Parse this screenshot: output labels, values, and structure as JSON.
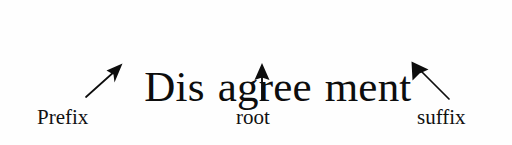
{
  "figure": {
    "kind": "word-morphology-diagram",
    "background_color": "#fefefe",
    "ink_color": "#0d0d0d"
  },
  "word": {
    "full": "Disagreement",
    "display": "Dis agree ment",
    "morphemes": [
      {
        "text": "Dis",
        "role": "prefix"
      },
      {
        "text": "agree",
        "role": "root"
      },
      {
        "text": "ment",
        "role": "suffix"
      }
    ]
  },
  "labels": [
    {
      "id": "prefix",
      "text": "Prefix"
    },
    {
      "id": "root",
      "text": "root"
    },
    {
      "id": "suffix",
      "text": "suffix"
    }
  ],
  "arrows": [
    {
      "id": "prefix-arrow",
      "points_to": "Dis",
      "direction": "up-right",
      "tail": [
        86,
        97
      ],
      "tip": [
        122,
        64
      ]
    },
    {
      "id": "root-arrow",
      "points_to": "agree",
      "direction": "up",
      "tail": [
        262,
        100
      ],
      "tip": [
        262,
        64
      ]
    },
    {
      "id": "suffix-arrow",
      "points_to": "ment",
      "direction": "up-left",
      "tail": [
        449,
        99
      ],
      "tip": [
        412,
        62
      ]
    }
  ]
}
